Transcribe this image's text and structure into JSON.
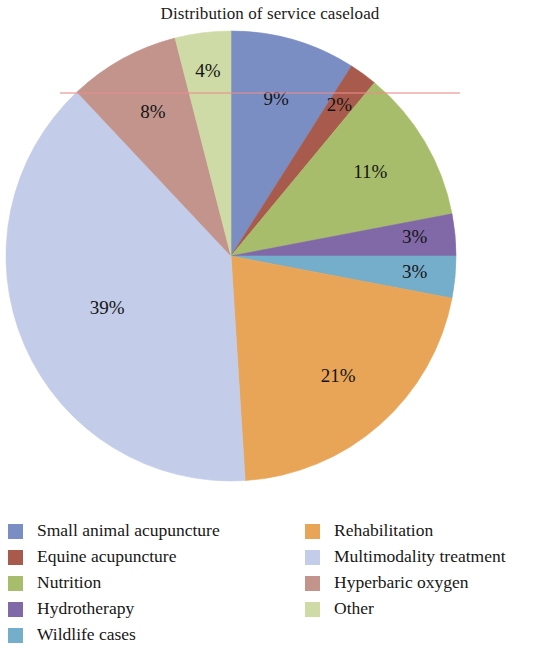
{
  "title": "Distribution of service caseload",
  "chart_data": {
    "type": "pie",
    "title": "Distribution of service caseload",
    "xlabel": "",
    "ylabel": "",
    "legend_position": "bottom",
    "grid": false,
    "start_angle_deg": 0,
    "direction": "clockwise",
    "labels": [
      "Small animal acupuncture",
      "Equine acupuncture",
      "Nutrition",
      "Hydrotherapy",
      "Wildlife cases",
      "Rehabilitation",
      "Multimodality treatment",
      "Hyperbaric oxygen",
      "Other"
    ],
    "values": [
      9,
      2,
      11,
      3,
      3,
      21,
      39,
      8,
      4
    ],
    "value_labels": [
      "9%",
      "2%",
      "11%",
      "3%",
      "3%",
      "21%",
      "39%",
      "8%",
      "4%"
    ],
    "colors": [
      "#7b8ec4",
      "#a85b4c",
      "#a8bd6b",
      "#8069a6",
      "#74aecb",
      "#e8a558",
      "#c3cce8",
      "#c2948c",
      "#cfdba6"
    ],
    "slices": [
      {
        "label": "Small animal acupuncture",
        "value": 9,
        "value_label": "9%",
        "color": "#7b8ec4"
      },
      {
        "label": "Equine acupuncture",
        "value": 2,
        "value_label": "2%",
        "color": "#a85b4c"
      },
      {
        "label": "Nutrition",
        "value": 11,
        "value_label": "11%",
        "color": "#a8bd6b"
      },
      {
        "label": "Hydrotherapy",
        "value": 3,
        "value_label": "3%",
        "color": "#8069a6"
      },
      {
        "label": "Wildlife cases",
        "value": 3,
        "value_label": "3%",
        "color": "#74aecb"
      },
      {
        "label": "Rehabilitation",
        "value": 21,
        "value_label": "21%",
        "color": "#e8a558"
      },
      {
        "label": "Multimodality treatment",
        "value": 39,
        "value_label": "39%",
        "color": "#c3cce8"
      },
      {
        "label": "Hyperbaric oxygen",
        "value": 8,
        "value_label": "8%",
        "color": "#c2948c"
      },
      {
        "label": "Other",
        "value": 4,
        "value_label": "4%",
        "color": "#cfdba6"
      }
    ]
  },
  "legend": {
    "left_column": [
      {
        "label": "Small animal acupuncture",
        "color": "#7b8ec4"
      },
      {
        "label": "Equine acupuncture",
        "color": "#a85b4c"
      },
      {
        "label": "Nutrition",
        "color": "#a8bd6b"
      },
      {
        "label": "Hydrotherapy",
        "color": "#8069a6"
      },
      {
        "label": "Wildlife cases",
        "color": "#74aecb"
      }
    ],
    "right_column": [
      {
        "label": "Rehabilitation",
        "color": "#e8a558"
      },
      {
        "label": "Multimodality treatment",
        "color": "#c3cce8"
      },
      {
        "label": "Hyperbaric oxygen",
        "color": "#c2948c"
      },
      {
        "label": "Other",
        "color": "#cfdba6"
      }
    ]
  },
  "geometry": {
    "center_x": 231,
    "center_y": 256,
    "radius": 225,
    "label_radius_ratio": 0.72
  }
}
